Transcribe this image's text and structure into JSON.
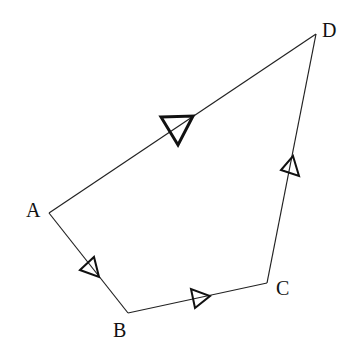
{
  "diagram": {
    "type": "directed quadrilateral path",
    "vertices": [
      {
        "id": "A",
        "label": "A",
        "x": 49,
        "y": 213,
        "lx": 26,
        "ly": 200
      },
      {
        "id": "B",
        "label": "B",
        "x": 128,
        "y": 313,
        "lx": 113,
        "ly": 320
      },
      {
        "id": "C",
        "label": "C",
        "x": 267,
        "y": 283,
        "lx": 276,
        "ly": 278
      },
      {
        "id": "D",
        "label": "D",
        "x": 316,
        "y": 34,
        "lx": 322,
        "ly": 20
      }
    ],
    "edges": [
      {
        "from": "A",
        "to": "B",
        "arrow": "small"
      },
      {
        "from": "B",
        "to": "C",
        "arrow": "small"
      },
      {
        "from": "C",
        "to": "D",
        "arrow": "small"
      },
      {
        "from": "A",
        "to": "D",
        "arrow": "large"
      }
    ],
    "line_color": "#222222"
  }
}
